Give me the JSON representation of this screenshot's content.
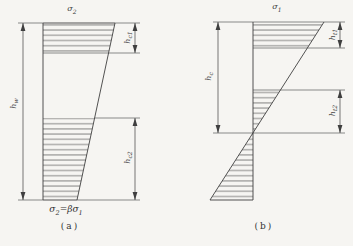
{
  "figure": {
    "background": "#f6f5f2",
    "line_color": "#3f3f3f"
  },
  "diagram_a": {
    "top_stress": {
      "base": "σ",
      "sub": "2"
    },
    "left_dim": {
      "base": "h",
      "sub": "w"
    },
    "upper_right_dim": {
      "base": "h",
      "sub": "c1"
    },
    "lower_right_dim": {
      "base": "h",
      "sub": "c2"
    },
    "caption_formula": {
      "p1": "σ",
      "s1": "2",
      "p2": "=β",
      "p3": "σ",
      "s2": "1"
    },
    "caption": "(a)"
  },
  "diagram_b": {
    "top_stress": {
      "base": "σ",
      "sub": "1"
    },
    "left_dim": {
      "base": "h",
      "sub": "c"
    },
    "upper_right_dim": {
      "base": "h",
      "sub": "t1"
    },
    "lower_right_dim": {
      "base": "h",
      "sub": "t2"
    },
    "caption": "(b)"
  }
}
